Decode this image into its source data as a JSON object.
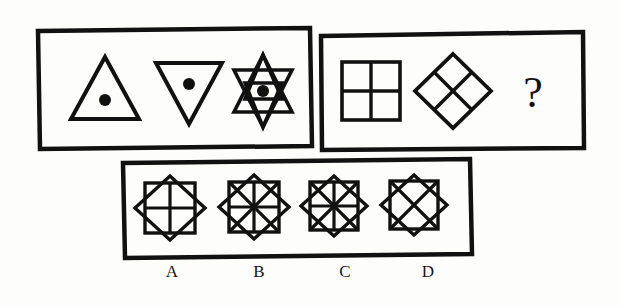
{
  "puzzle": {
    "kind": "visual-analogy-matrix",
    "background_color": "#fdfdfc",
    "ink_color": "#111111",
    "question_mark": "?",
    "panels": [
      {
        "id": "premise-panel",
        "name": "premise-row",
        "frame": {
          "x": 37,
          "y": 30,
          "w": 273,
          "h": 117,
          "stroke": 4
        },
        "figures": [
          {
            "id": "figure-up-triangle-dot",
            "shape": "triangle-up",
            "fill": "none",
            "has_center_dot": true,
            "cx": 105,
            "cy": 89,
            "size": 62
          },
          {
            "id": "figure-down-triangle-dot",
            "shape": "triangle-down",
            "fill": "none",
            "has_center_dot": true,
            "cx": 188,
            "cy": 88,
            "size": 60
          },
          {
            "id": "figure-six-point-star-dot",
            "shape": "hexagram",
            "fill": "none",
            "has_center_dot": true,
            "cx": 263,
            "cy": 90,
            "size": 64
          }
        ]
      },
      {
        "id": "question-panel",
        "name": "question-row",
        "frame": {
          "x": 320,
          "y": 33,
          "w": 263,
          "h": 115,
          "stroke": 4
        },
        "figures": [
          {
            "id": "figure-square-quadrants",
            "shape": "square-quartered",
            "fill": "none",
            "has_center_dot": false,
            "cx": 371,
            "cy": 90,
            "size": 58
          },
          {
            "id": "figure-diamond-quadrants",
            "shape": "diamond-quartered",
            "fill": "none",
            "has_center_dot": false,
            "cx": 453,
            "cy": 90,
            "size": 72
          },
          {
            "id": "figure-question-mark",
            "shape": "question-mark",
            "label": "?",
            "cx": 533,
            "cy": 90,
            "size": 44
          }
        ]
      },
      {
        "id": "options-panel",
        "name": "answer-options-row",
        "frame": {
          "corners": [
            [
              122,
              162
            ],
            [
              470,
              160
            ],
            [
              472,
              256
            ],
            [
              124,
              258
            ]
          ],
          "stroke": 4,
          "skewed": true
        },
        "figures": [
          {
            "id": "option-a",
            "label": "A",
            "label_x": 172,
            "label_y": 272,
            "shape": "octagram-square-diamond",
            "inner_lines": "cross",
            "cx": 170,
            "cy": 208,
            "size": 62
          },
          {
            "id": "option-b",
            "label": "B",
            "label_x": 259,
            "label_y": 272,
            "shape": "octagram-square-diamond",
            "inner_lines": "cross-and-diagonals",
            "cx": 254,
            "cy": 207,
            "size": 62
          },
          {
            "id": "option-c",
            "label": "C",
            "label_x": 345,
            "label_y": 272,
            "shape": "octagram-square-diamond",
            "inner_lines": "cross-and-diagonals",
            "cx": 334,
            "cy": 207,
            "size": 60
          },
          {
            "id": "option-d",
            "label": "D",
            "label_x": 428,
            "label_y": 272,
            "shape": "octagram-square-diamond",
            "inner_lines": "diagonals",
            "cx": 414,
            "cy": 206,
            "size": 60
          }
        ]
      }
    ]
  }
}
